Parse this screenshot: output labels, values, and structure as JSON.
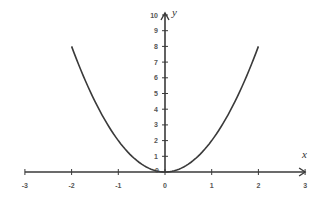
{
  "chart_data": {
    "type": "line",
    "title": "",
    "xlabel": "x",
    "ylabel": "y",
    "function": "y = 2x^2",
    "xlim": [
      -3,
      3
    ],
    "ylim": [
      0,
      10
    ],
    "grid": false,
    "legend": null,
    "x_ticks": [
      -3,
      -2,
      -1,
      0,
      1,
      2,
      3
    ],
    "y_ticks": [
      0,
      1,
      2,
      3,
      4,
      5,
      6,
      7,
      8,
      9,
      10
    ],
    "series": [
      {
        "name": "parabola",
        "x": [
          -2,
          -1.5,
          -1,
          -0.5,
          0,
          0.5,
          1,
          1.5,
          2
        ],
        "y": [
          8,
          4.5,
          2,
          0.5,
          0,
          0.5,
          2,
          4.5,
          8
        ],
        "color": "#3a3a3a"
      }
    ]
  },
  "colors": {
    "axis": "#3a3a3a",
    "curve": "#3a3a3a",
    "label": "#555555"
  }
}
